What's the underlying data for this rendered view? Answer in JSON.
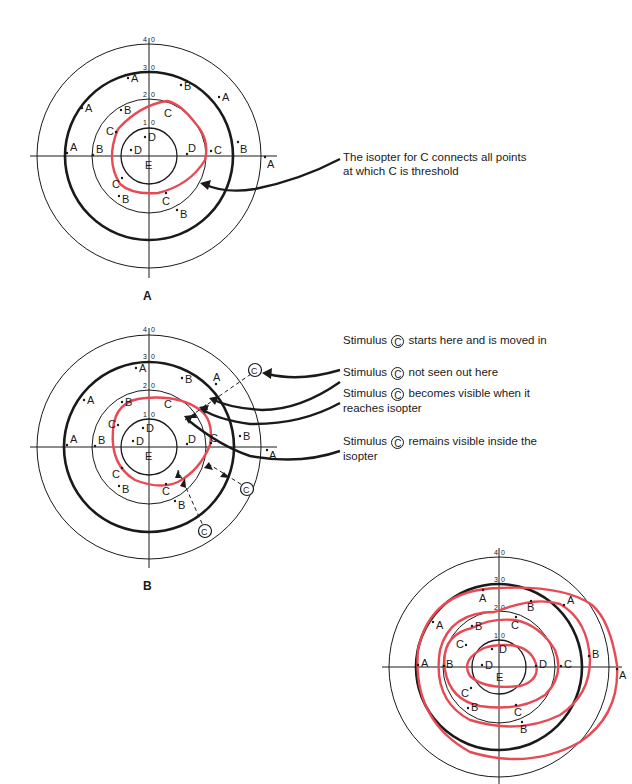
{
  "figure_a": {
    "caption": "A",
    "annotation_line1": "The isopter for C connects all points",
    "annotation_line2": "at which C is threshold"
  },
  "figure_b": {
    "caption": "B",
    "stimulus_symbol": "C",
    "notes": [
      {
        "prefix": "Stimulus",
        "suffix": "starts here and is moved in",
        "line2": ""
      },
      {
        "prefix": "Stimulus",
        "suffix": "not seen out here",
        "line2": ""
      },
      {
        "prefix": "Stimulus",
        "suffix": "becomes visible when it",
        "line2": "reaches isopter"
      },
      {
        "prefix": "Stimulus",
        "suffix": "remains visible inside the",
        "line2": "isopter"
      }
    ]
  },
  "figure_c": {
    "caption": ""
  },
  "axis_ticks": [
    "10",
    "20",
    "30",
    "40"
  ],
  "point_labels": {
    "A": "A",
    "B": "B",
    "C": "C",
    "D": "D",
    "E": "E"
  },
  "colors": {
    "isopter": "#e84a55",
    "ink": "#1a1a1a"
  }
}
